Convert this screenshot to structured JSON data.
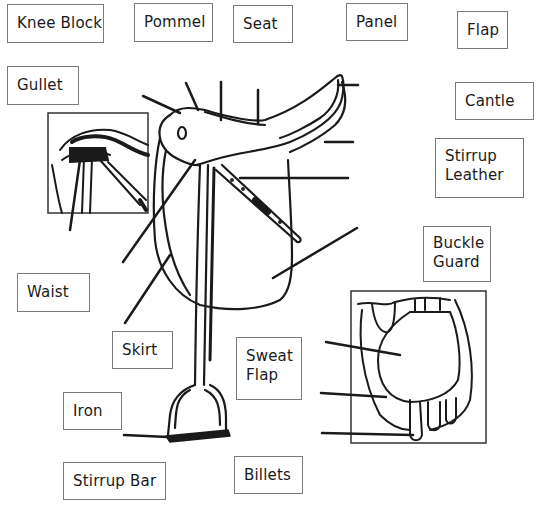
{
  "diagram": {
    "labels": [
      {
        "id": "knee-block",
        "text": "Knee Block",
        "lines": [
          "Knee Block"
        ],
        "box": [
          7,
          4,
          97,
          39
        ]
      },
      {
        "id": "pommel",
        "text": "Pommel",
        "lines": [
          "Pommel"
        ],
        "box": [
          134,
          3,
          79,
          39
        ]
      },
      {
        "id": "seat",
        "text": "Seat",
        "lines": [
          "Seat"
        ],
        "box": [
          233,
          5,
          60,
          38
        ]
      },
      {
        "id": "panel",
        "text": "Panel",
        "lines": [
          "Panel"
        ],
        "box": [
          346,
          3,
          62,
          38
        ]
      },
      {
        "id": "flap",
        "text": "Flap",
        "lines": [
          "Flap"
        ],
        "box": [
          457,
          11,
          51,
          38
        ]
      },
      {
        "id": "gullet",
        "text": "Gullet",
        "lines": [
          "Gullet"
        ],
        "box": [
          7,
          66,
          72,
          39
        ]
      },
      {
        "id": "cantle",
        "text": "Cantle",
        "lines": [
          "Cantle"
        ],
        "box": [
          455,
          82,
          79,
          38
        ]
      },
      {
        "id": "stirrup-leather",
        "text": "Stirrup Leather",
        "lines": [
          "Stirrup",
          "Leather"
        ],
        "box": [
          435,
          138,
          89,
          60
        ]
      },
      {
        "id": "buckle-guard",
        "text": "Buckle Guard",
        "lines": [
          "Buckle",
          "Guard"
        ],
        "box": [
          423,
          226,
          68,
          56
        ]
      },
      {
        "id": "waist",
        "text": "Waist",
        "lines": [
          "Waist"
        ],
        "box": [
          17,
          273,
          73,
          39
        ]
      },
      {
        "id": "skirt",
        "text": "Skirt",
        "lines": [
          "Skirt"
        ],
        "box": [
          112,
          331,
          61,
          38
        ]
      },
      {
        "id": "sweat-flap",
        "text": "Sweat Flap",
        "lines": [
          "Sweat",
          "Flap"
        ],
        "box": [
          236,
          337,
          66,
          63
        ]
      },
      {
        "id": "iron",
        "text": "Iron",
        "lines": [
          "Iron"
        ],
        "box": [
          63,
          392,
          59,
          38
        ]
      },
      {
        "id": "billets",
        "text": "Billets",
        "lines": [
          "Billets"
        ],
        "box": [
          234,
          456,
          69,
          38
        ]
      },
      {
        "id": "stirrup-bar",
        "text": "Stirrup Bar",
        "lines": [
          "Stirrup Bar"
        ],
        "box": [
          63,
          462,
          103,
          38
        ]
      }
    ],
    "insets": [
      {
        "id": "stirrup-bar-detail-inset",
        "box": [
          48,
          113,
          100,
          100
        ]
      },
      {
        "id": "underside-detail-inset",
        "box": [
          351,
          291,
          135,
          152
        ]
      }
    ],
    "colors": {
      "ink": "#1a1a1a",
      "box_border": "#7a7a7a",
      "background": "#ffffff"
    }
  }
}
